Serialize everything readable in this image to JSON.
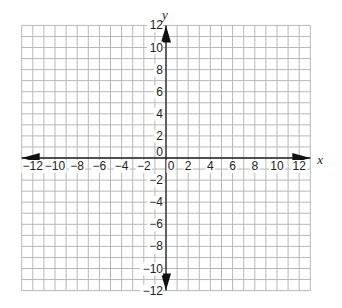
{
  "chart_data": {
    "type": "coordinate-grid",
    "title": "",
    "xlabel": "x",
    "ylabel": "y",
    "xlim": [
      -13,
      13
    ],
    "ylim": [
      -12,
      12
    ],
    "grid": true,
    "grid_step": 1,
    "x_ticks": [
      -12,
      -10,
      -8,
      -6,
      -4,
      -2,
      0,
      2,
      4,
      6,
      8,
      10,
      12
    ],
    "x_tick_labels": [
      "−12",
      "−10",
      "−8",
      "−6",
      "−4",
      "−2",
      "0",
      "2",
      "4",
      "6",
      "8",
      "10",
      "12"
    ],
    "y_ticks": [
      12,
      10,
      8,
      6,
      4,
      2,
      0,
      -2,
      -4,
      -6,
      -8,
      -10,
      -12
    ],
    "y_tick_labels": [
      "12",
      "10",
      "8",
      "6",
      "4",
      "2",
      "0",
      "−2",
      "−4",
      "−6",
      "−8",
      "−10",
      "−12"
    ],
    "arrows": [
      "x-positive",
      "x-negative",
      "y-positive",
      "y-negative"
    ]
  }
}
